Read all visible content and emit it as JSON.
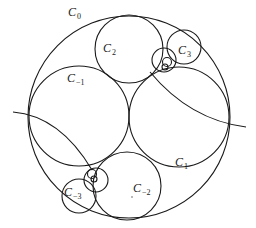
{
  "diagram": {
    "title": "",
    "stroke_color": "#1a1a1a",
    "circles": [
      {
        "id": "C0",
        "cx": 129,
        "cy": 117,
        "r": 101
      },
      {
        "id": "C-1",
        "cx": 79,
        "cy": 116,
        "r": 50
      },
      {
        "id": "C1",
        "cx": 179,
        "cy": 117,
        "r": 50
      },
      {
        "id": "C2",
        "cx": 129,
        "cy": 49,
        "r": 34
      },
      {
        "id": "C-2",
        "cx": 127,
        "cy": 186,
        "r": 34
      },
      {
        "id": "C3",
        "cx": 184,
        "cy": 47,
        "r": 17
      },
      {
        "id": "C-3",
        "cx": 79,
        "cy": 196,
        "r": 17
      },
      {
        "id": "small-upper",
        "cx": 164,
        "cy": 60,
        "r": 12
      },
      {
        "id": "tiny-upper-1",
        "cx": 167,
        "cy": 62,
        "r": 4.5
      },
      {
        "id": "tiny-upper-2",
        "cx": 165,
        "cy": 67,
        "r": 3
      },
      {
        "id": "small-lower",
        "cx": 96,
        "cy": 180,
        "r": 12
      },
      {
        "id": "tiny-lower-1",
        "cx": 92,
        "cy": 174,
        "r": 4.5
      },
      {
        "id": "tiny-lower-2",
        "cx": 94,
        "cy": 179,
        "r": 3
      }
    ],
    "labels": [
      {
        "text": "C",
        "sub": "0",
        "x": 68,
        "y": 6
      },
      {
        "text": "C",
        "sub": "2",
        "x": 103,
        "y": 42
      },
      {
        "text": "C",
        "sub": "3",
        "x": 178,
        "y": 44
      },
      {
        "text": "C",
        "sub": "−1",
        "x": 67,
        "y": 72
      },
      {
        "text": "C",
        "sub": "1",
        "x": 175,
        "y": 156
      },
      {
        "text": "C",
        "sub": "−2",
        "x": 133,
        "y": 182
      },
      {
        "text": "C",
        "sub": "−3",
        "x": 64,
        "y": 186
      }
    ],
    "arcs": [
      {
        "id": "left-arc",
        "d": "M 13 112 Q 60 116 92 170"
      },
      {
        "id": "right-arc",
        "d": "M 150 72 Q 190 120 246 127"
      }
    ]
  }
}
